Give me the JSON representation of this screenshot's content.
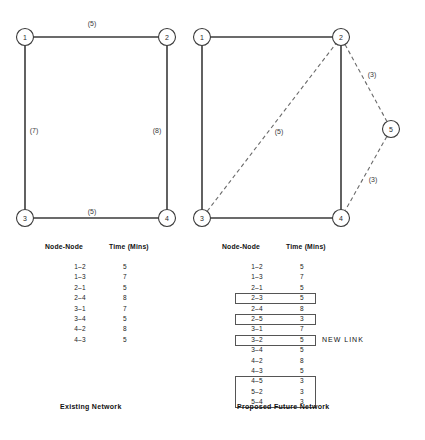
{
  "figure": {
    "left": {
      "caption": "Existing Network",
      "nodes": [
        {
          "id": "1",
          "x": 25,
          "y": 37
        },
        {
          "id": "2",
          "x": 167,
          "y": 37
        },
        {
          "id": "3",
          "x": 25,
          "y": 218
        },
        {
          "id": "4",
          "x": 167,
          "y": 218
        }
      ],
      "edges": [
        {
          "from": "1",
          "to": "2",
          "label": "(5)",
          "style": "solid",
          "lx": 92,
          "ly": 23
        },
        {
          "from": "1",
          "to": "3",
          "label": "(7)",
          "style": "solid",
          "lx": 34,
          "ly": 130
        },
        {
          "from": "2",
          "to": "4",
          "label": "(8)",
          "style": "solid",
          "lx": 157,
          "ly": 130
        },
        {
          "from": "3",
          "to": "4",
          "label": "(5)",
          "style": "solid",
          "lx": 92,
          "ly": 211
        }
      ],
      "table": {
        "headers": [
          "Node-Node",
          "Time  (Mins)"
        ],
        "rows": [
          {
            "pair": "1–2",
            "time": "5",
            "boxed": false
          },
          {
            "pair": "1–3",
            "time": "7",
            "boxed": false
          },
          {
            "pair": "2–1",
            "time": "5",
            "boxed": false
          },
          {
            "pair": "2–4",
            "time": "8",
            "boxed": false
          },
          {
            "pair": "3–1",
            "time": "7",
            "boxed": false
          },
          {
            "pair": "3–4",
            "time": "5",
            "boxed": false
          },
          {
            "pair": "4–2",
            "time": "8",
            "boxed": false
          },
          {
            "pair": "4–3",
            "time": "5",
            "boxed": false
          }
        ]
      }
    },
    "right": {
      "caption": "Proposed Future Network",
      "new_link_note": "NEW LINK",
      "nodes": [
        {
          "id": "1",
          "x": 202,
          "y": 37
        },
        {
          "id": "2",
          "x": 341,
          "y": 37
        },
        {
          "id": "3",
          "x": 202,
          "y": 218
        },
        {
          "id": "4",
          "x": 341,
          "y": 218
        },
        {
          "id": "5",
          "x": 391,
          "y": 129
        }
      ],
      "edges": [
        {
          "from": "1",
          "to": "2",
          "label": "",
          "style": "solid"
        },
        {
          "from": "1",
          "to": "3",
          "label": "",
          "style": "solid"
        },
        {
          "from": "2",
          "to": "4",
          "label": "",
          "style": "solid"
        },
        {
          "from": "3",
          "to": "4",
          "label": "",
          "style": "solid"
        },
        {
          "from": "3",
          "to": "2",
          "label": "(5)",
          "style": "dashed",
          "lx": 279,
          "ly": 131
        },
        {
          "from": "2",
          "to": "5",
          "label": "(3)",
          "style": "dashed",
          "lx": 372,
          "ly": 74
        },
        {
          "from": "5",
          "to": "4",
          "label": "(3)",
          "style": "dashed",
          "lx": 373,
          "ly": 179
        }
      ],
      "table": {
        "headers": [
          "Node-Node",
          "Time  (Mins)"
        ],
        "rows": [
          {
            "pair": "1–2",
            "time": "5",
            "boxed": false
          },
          {
            "pair": "1–3",
            "time": "7",
            "boxed": false
          },
          {
            "pair": "2–1",
            "time": "5",
            "boxed": false
          },
          {
            "pair": "2–3",
            "time": "5",
            "boxed": true
          },
          {
            "pair": "2–4",
            "time": "8",
            "boxed": false
          },
          {
            "pair": "2–5",
            "time": "3",
            "boxed": true
          },
          {
            "pair": "3–1",
            "time": "7",
            "boxed": false
          },
          {
            "pair": "3–2",
            "time": "5",
            "boxed": true,
            "note": "NEW LINK"
          },
          {
            "pair": "3–4",
            "time": "5",
            "boxed": false
          },
          {
            "pair": "4–2",
            "time": "8",
            "boxed": false
          },
          {
            "pair": "4–3",
            "time": "5",
            "boxed": false
          },
          {
            "pair": "4–5",
            "time": "3",
            "boxed": true
          },
          {
            "pair": "5–2",
            "time": "3",
            "boxed": true
          },
          {
            "pair": "5–4",
            "time": "3",
            "boxed": true
          }
        ]
      }
    }
  },
  "style": {
    "node_radius": 8.5,
    "solid_color": "#3a3a3a",
    "dashed_color": "#6a6a6a",
    "background": "#ffffff"
  }
}
